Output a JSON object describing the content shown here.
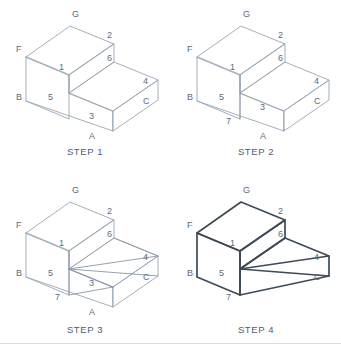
{
  "figure": {
    "panel_count": 4,
    "line_color": "#9aa6b4",
    "bold_line_color": "#3f4a57",
    "label_color": "#5b6b7c",
    "background": "#ffffff"
  },
  "panels": [
    {
      "id": "step-1",
      "caption": "STEP 1",
      "description": "Stepped block in isometric view with vertices lettered and numbered",
      "labels": [
        {
          "text": "G",
          "x": 72,
          "y": 17
        },
        {
          "text": "2",
          "x": 107,
          "y": 38
        },
        {
          "text": "F",
          "x": 16,
          "y": 52
        },
        {
          "text": "6",
          "x": 107,
          "y": 61
        },
        {
          "text": "1",
          "x": 59,
          "y": 70
        },
        {
          "text": "4",
          "x": 143,
          "y": 84
        },
        {
          "text": "B",
          "x": 16,
          "y": 100
        },
        {
          "text": "5",
          "x": 48,
          "y": 100
        },
        {
          "text": "C",
          "x": 143,
          "y": 104
        },
        {
          "text": "3",
          "x": 89,
          "y": 119
        },
        {
          "text": "A",
          "x": 89,
          "y": 139
        }
      ]
    },
    {
      "id": "step-2",
      "caption": "STEP 2",
      "description": "Vertical edge added from point 1 through 5 down to new point 7",
      "labels": [
        {
          "text": "G",
          "x": 72,
          "y": 17
        },
        {
          "text": "2",
          "x": 107,
          "y": 38
        },
        {
          "text": "F",
          "x": 16,
          "y": 52
        },
        {
          "text": "6",
          "x": 107,
          "y": 61
        },
        {
          "text": "1",
          "x": 59,
          "y": 70
        },
        {
          "text": "4",
          "x": 143,
          "y": 84
        },
        {
          "text": "B",
          "x": 16,
          "y": 100
        },
        {
          "text": "5",
          "x": 48,
          "y": 100
        },
        {
          "text": "C",
          "x": 143,
          "y": 104
        },
        {
          "text": "3",
          "x": 89,
          "y": 110
        },
        {
          "text": "7",
          "x": 55,
          "y": 124
        },
        {
          "text": "A",
          "x": 89,
          "y": 139
        }
      ]
    },
    {
      "id": "step-3",
      "caption": "STEP 3",
      "description": "Cut lines drawn from point 5 to points 4, C and 3, and from 6 to 4",
      "labels": [
        {
          "text": "G",
          "x": 72,
          "y": 17
        },
        {
          "text": "2",
          "x": 107,
          "y": 38
        },
        {
          "text": "F",
          "x": 16,
          "y": 52
        },
        {
          "text": "6",
          "x": 107,
          "y": 61
        },
        {
          "text": "1",
          "x": 59,
          "y": 70
        },
        {
          "text": "4",
          "x": 143,
          "y": 84
        },
        {
          "text": "B",
          "x": 16,
          "y": 100
        },
        {
          "text": "5",
          "x": 48,
          "y": 100
        },
        {
          "text": "C",
          "x": 143,
          "y": 104
        },
        {
          "text": "3",
          "x": 89,
          "y": 110
        },
        {
          "text": "7",
          "x": 55,
          "y": 124
        },
        {
          "text": "A",
          "x": 89,
          "y": 139
        }
      ]
    },
    {
      "id": "step-4",
      "caption": "STEP 4",
      "description": "Finished solid with waste removed; points 3 and A no longer exist",
      "labels": [
        {
          "text": "G",
          "x": 72,
          "y": 17
        },
        {
          "text": "2",
          "x": 107,
          "y": 38
        },
        {
          "text": "F",
          "x": 16,
          "y": 52
        },
        {
          "text": "6",
          "x": 107,
          "y": 61
        },
        {
          "text": "1",
          "x": 59,
          "y": 70
        },
        {
          "text": "4",
          "x": 143,
          "y": 84
        },
        {
          "text": "B",
          "x": 16,
          "y": 100
        },
        {
          "text": "5",
          "x": 48,
          "y": 100
        },
        {
          "text": "C",
          "x": 143,
          "y": 104
        },
        {
          "text": "7",
          "x": 55,
          "y": 124
        }
      ]
    }
  ]
}
